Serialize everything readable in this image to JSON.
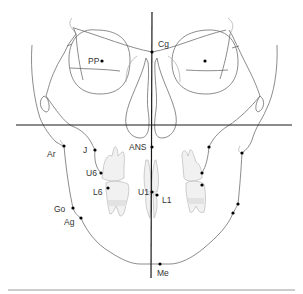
{
  "diagram": {
    "colors": {
      "axis": "#1a1a1a",
      "outline": "#6e6e6e",
      "tooth_fill": "#f1f1f1",
      "point": "#000000",
      "bottom_rule": "#9a9a9a"
    },
    "labels": {
      "pp": "PP",
      "cg": "Cg",
      "ans": "ANS",
      "j": "J",
      "ar": "Ar",
      "u6": "U6",
      "l6": "L6",
      "u1": "U1",
      "l1": "L1",
      "go": "Go",
      "ag": "Ag",
      "me": "Me"
    },
    "landmarks": [
      {
        "name": "PP",
        "x": 102,
        "y": 61,
        "side": "right"
      },
      {
        "name": "PP-contralateral",
        "x": 205,
        "y": 61,
        "side": "left"
      },
      {
        "name": "Cg",
        "x": 152,
        "y": 52
      },
      {
        "name": "ANS",
        "x": 152,
        "y": 147
      },
      {
        "name": "J",
        "x": 95,
        "y": 150,
        "side": "right"
      },
      {
        "name": "J-contralateral",
        "x": 209,
        "y": 147,
        "side": "left"
      },
      {
        "name": "Ar",
        "x": 64,
        "y": 146,
        "side": "right"
      },
      {
        "name": "Ar-contralateral",
        "x": 242,
        "y": 153,
        "side": "left"
      },
      {
        "name": "U6",
        "x": 101,
        "y": 173,
        "side": "right"
      },
      {
        "name": "U6-contralateral",
        "x": 202,
        "y": 173,
        "side": "left"
      },
      {
        "name": "L6",
        "x": 108,
        "y": 188,
        "side": "right"
      },
      {
        "name": "L6-contralateral",
        "x": 202,
        "y": 185,
        "side": "left"
      },
      {
        "name": "U1",
        "x": 152,
        "y": 192
      },
      {
        "name": "L1",
        "x": 157,
        "y": 195
      },
      {
        "name": "Go",
        "x": 73,
        "y": 208,
        "side": "right"
      },
      {
        "name": "Go-contralateral",
        "x": 238,
        "y": 204,
        "side": "left"
      },
      {
        "name": "Ag",
        "x": 81,
        "y": 218,
        "side": "right"
      },
      {
        "name": "Ag-contralateral",
        "x": 233,
        "y": 213,
        "side": "left"
      }
    ],
    "me_point": {
      "name": "Me",
      "x": 160,
      "y": 264
    },
    "reference_lines": {
      "midsagittal": {
        "x1": 152,
        "y1": 12,
        "x2": 151,
        "y2": 278
      },
      "horizontal": {
        "x1": 16,
        "y1": 125,
        "x2": 292,
        "y2": 125
      }
    }
  }
}
